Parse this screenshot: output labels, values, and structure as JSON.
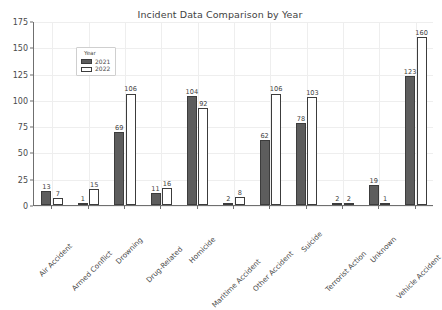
{
  "chart_data": {
    "type": "bar",
    "title": "Incident Data Comparison by Year",
    "xlabel": "",
    "ylabel": "",
    "ylim": [
      0,
      175
    ],
    "yticks": [
      0,
      25,
      50,
      75,
      100,
      125,
      150,
      175
    ],
    "grid": true,
    "legend": {
      "title": "Year",
      "position": "upper left",
      "entries": [
        {
          "label": "2021",
          "color": "#5d5d5d",
          "style": "filled"
        },
        {
          "label": "2022",
          "color": "#ffffff",
          "style": "outlined"
        }
      ]
    },
    "categories": [
      "Air Accident",
      "Armed Conflict",
      "Drowning",
      "Drug-Related",
      "Homicide",
      "Maritime Accident",
      "Other Accident",
      "Suicide",
      "Terrorist Action",
      "Unknown",
      "Vehicle Accident"
    ],
    "series": [
      {
        "name": "2021",
        "values": [
          13,
          1,
          69,
          11,
          104,
          2,
          62,
          78,
          2,
          19,
          123
        ]
      },
      {
        "name": "2022",
        "values": [
          7,
          15,
          106,
          16,
          92,
          8,
          106,
          103,
          2,
          1,
          160
        ]
      }
    ]
  }
}
